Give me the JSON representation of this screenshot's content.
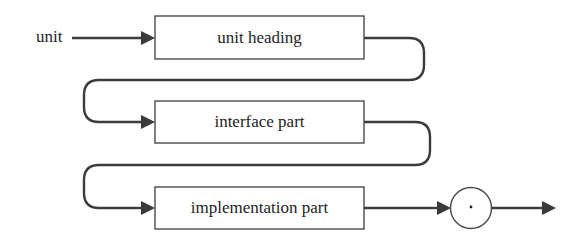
{
  "diagram": {
    "type": "syntax-diagram",
    "entry_label": "unit",
    "boxes": [
      {
        "label": "unit heading"
      },
      {
        "label": "interface part"
      },
      {
        "label": "implementation part"
      }
    ],
    "terminal": {
      "symbol": "·",
      "shape": "circle"
    },
    "colors": {
      "line": "#3c3c3c",
      "box_border": "#4a4a4a",
      "text": "#1e1e1e",
      "background": "#ffffff"
    }
  }
}
